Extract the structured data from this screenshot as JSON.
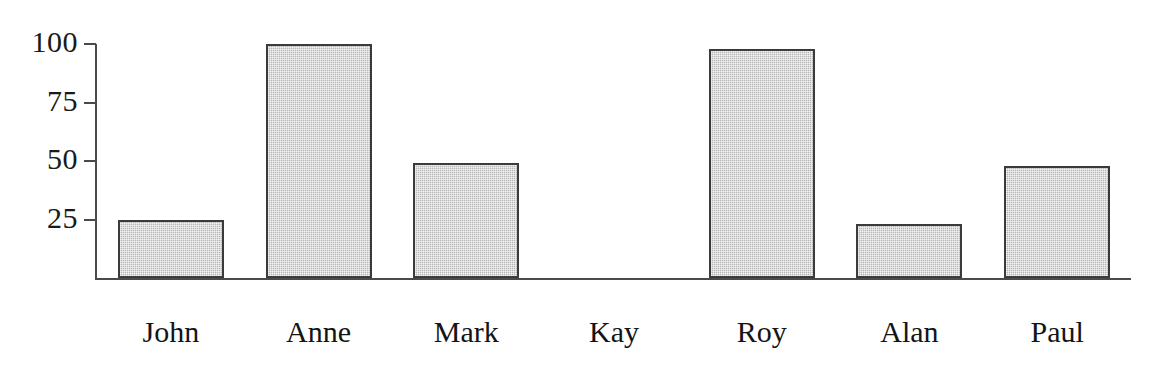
{
  "chart_data": {
    "type": "bar",
    "title": "",
    "subtitle": "",
    "xlabel": "",
    "ylabel": "",
    "categories": [
      "John",
      "Anne",
      "Mark",
      "Kay",
      "Roy",
      "Alan",
      "Paul"
    ],
    "values": [
      25,
      100,
      49,
      0,
      98,
      23,
      48
    ],
    "series": [
      {
        "name": "",
        "values": [
          25,
          100,
          49,
          0,
          98,
          23,
          48
        ]
      }
    ],
    "ylim": [
      0,
      100
    ],
    "yticks": [
      100,
      75,
      50,
      25
    ],
    "ytick_labels": [
      "100",
      "75",
      "50",
      "25"
    ],
    "grid": false,
    "legend": false,
    "legend_position": "none",
    "annotations": [],
    "bar_fill_color": "#b6b6b6",
    "bar_border_color": "#3b3b3b",
    "axis_color": "#4a4a4a",
    "background_color": "#ffffff",
    "text_color": "#141414"
  },
  "axis": {
    "y_ticks": [
      {
        "label": "100",
        "value": 100
      },
      {
        "label": "75",
        "value": 75
      },
      {
        "label": "50",
        "value": 50
      },
      {
        "label": "25",
        "value": 25
      }
    ]
  },
  "bars": [
    {
      "label": "John",
      "value": 25
    },
    {
      "label": "Anne",
      "value": 100
    },
    {
      "label": "Mark",
      "value": 49
    },
    {
      "label": "Kay",
      "value": 0
    },
    {
      "label": "Roy",
      "value": 98
    },
    {
      "label": "Alan",
      "value": 23
    },
    {
      "label": "Paul",
      "value": 48
    }
  ]
}
